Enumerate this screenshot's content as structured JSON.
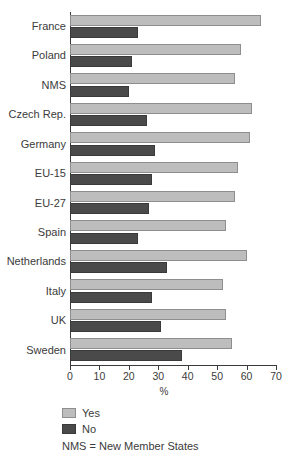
{
  "title": "EU towards other countries?",
  "chart_data": {
    "type": "bar",
    "orientation": "horizontal",
    "title": "EU towards other countries?",
    "xlabel": "%",
    "ylabel": "",
    "xlim": [
      0,
      70
    ],
    "xticks": [
      0,
      10,
      20,
      30,
      40,
      50,
      60,
      70
    ],
    "grid": false,
    "legend_position": "below-left",
    "categories": [
      "France",
      "Poland",
      "NMS",
      "Czech Rep.",
      "Germany",
      "EU-15",
      "EU-27",
      "Spain",
      "Netherlands",
      "Italy",
      "UK",
      "Sweden"
    ],
    "series": [
      {
        "name": "Yes",
        "color": "#bdbdbd",
        "values": [
          65,
          58,
          56,
          62,
          61,
          57,
          56,
          53,
          60,
          52,
          53,
          55
        ]
      },
      {
        "name": "No",
        "color": "#4a4a4a",
        "values": [
          23,
          21,
          20,
          26,
          29,
          28,
          27,
          23,
          33,
          28,
          31,
          38
        ]
      }
    ],
    "note": "NMS = New Member States"
  },
  "legend": {
    "items": [
      {
        "label": "Yes",
        "color": "#bdbdbd"
      },
      {
        "label": "No",
        "color": "#4a4a4a"
      }
    ],
    "note": "NMS = New Member States"
  },
  "axis": {
    "x_title": "%"
  }
}
